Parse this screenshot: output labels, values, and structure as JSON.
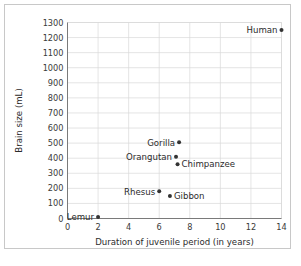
{
  "chart_data": {
    "type": "scatter",
    "title": "",
    "xlabel": "Duration of juvenile period (in years)",
    "ylabel": "Brain size (mL)",
    "xlim": [
      0,
      14
    ],
    "ylim": [
      0,
      1300
    ],
    "xticks": [
      0,
      2,
      4,
      6,
      8,
      10,
      12,
      14
    ],
    "yticks": [
      0,
      100,
      200,
      300,
      400,
      500,
      600,
      700,
      800,
      900,
      1000,
      1100,
      1200,
      1300
    ],
    "grid": true,
    "legend": "none",
    "points": [
      {
        "label": "Lemur",
        "x": 2,
        "y": 10,
        "label_side": "left"
      },
      {
        "label": "Rhesus",
        "x": 6,
        "y": 180,
        "label_side": "left"
      },
      {
        "label": "Gibbon",
        "x": 6.7,
        "y": 150,
        "label_side": "right"
      },
      {
        "label": "Orangutan",
        "x": 7.1,
        "y": 410,
        "label_side": "left"
      },
      {
        "label": "Chimpanzee",
        "x": 7.2,
        "y": 360,
        "label_side": "right"
      },
      {
        "label": "Gorilla",
        "x": 7.3,
        "y": 505,
        "label_side": "left"
      },
      {
        "label": "Human",
        "x": 14,
        "y": 1250,
        "label_side": "left"
      }
    ]
  },
  "axis": {
    "x_title": "Duration of juvenile period (in years)",
    "y_title": "Brain size (mL)",
    "x_tick_labels": [
      "0",
      "2",
      "4",
      "6",
      "8",
      "10",
      "12",
      "14"
    ],
    "y_tick_labels": [
      "0",
      "100",
      "200",
      "300",
      "400",
      "500",
      "600",
      "700",
      "800",
      "900",
      "1000",
      "1100",
      "1200",
      "1300"
    ]
  },
  "colors": {
    "marker": "#333333",
    "grid": "#d9d9d9",
    "axis": "#7a7a7a",
    "frame_border": "#c8c8c8",
    "background": "#ffffff",
    "text": "#2b2b2b"
  }
}
